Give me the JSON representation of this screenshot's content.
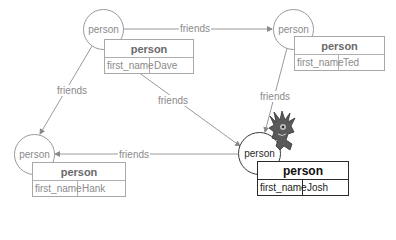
{
  "nodes": [
    {
      "id": "dave",
      "circle_label": "person",
      "table_title": "person",
      "field": "first_name",
      "value": "Dave"
    },
    {
      "id": "ted",
      "circle_label": "person",
      "table_title": "person",
      "field": "first_name",
      "value": "Ted"
    },
    {
      "id": "hank",
      "circle_label": "person",
      "table_title": "person",
      "field": "first_name",
      "value": "Hank"
    },
    {
      "id": "josh",
      "circle_label": "person",
      "table_title": "person",
      "field": "first_name",
      "value": "Josh",
      "selected": true
    }
  ],
  "edges": [
    {
      "from": "dave",
      "to": "ted",
      "label": "friends"
    },
    {
      "from": "dave",
      "to": "hank",
      "label": "friends"
    },
    {
      "from": "dave",
      "to": "josh",
      "label": "friends"
    },
    {
      "from": "ted",
      "to": "josh",
      "label": "friends"
    },
    {
      "from": "josh",
      "to": "hank",
      "label": "friends"
    }
  ],
  "icons": {
    "mascot": "goblin-mascot-icon"
  },
  "colors": {
    "edge": "#9a9a9a",
    "active_border": "#2a2a2a",
    "inactive_text": "#8a8a8a"
  }
}
